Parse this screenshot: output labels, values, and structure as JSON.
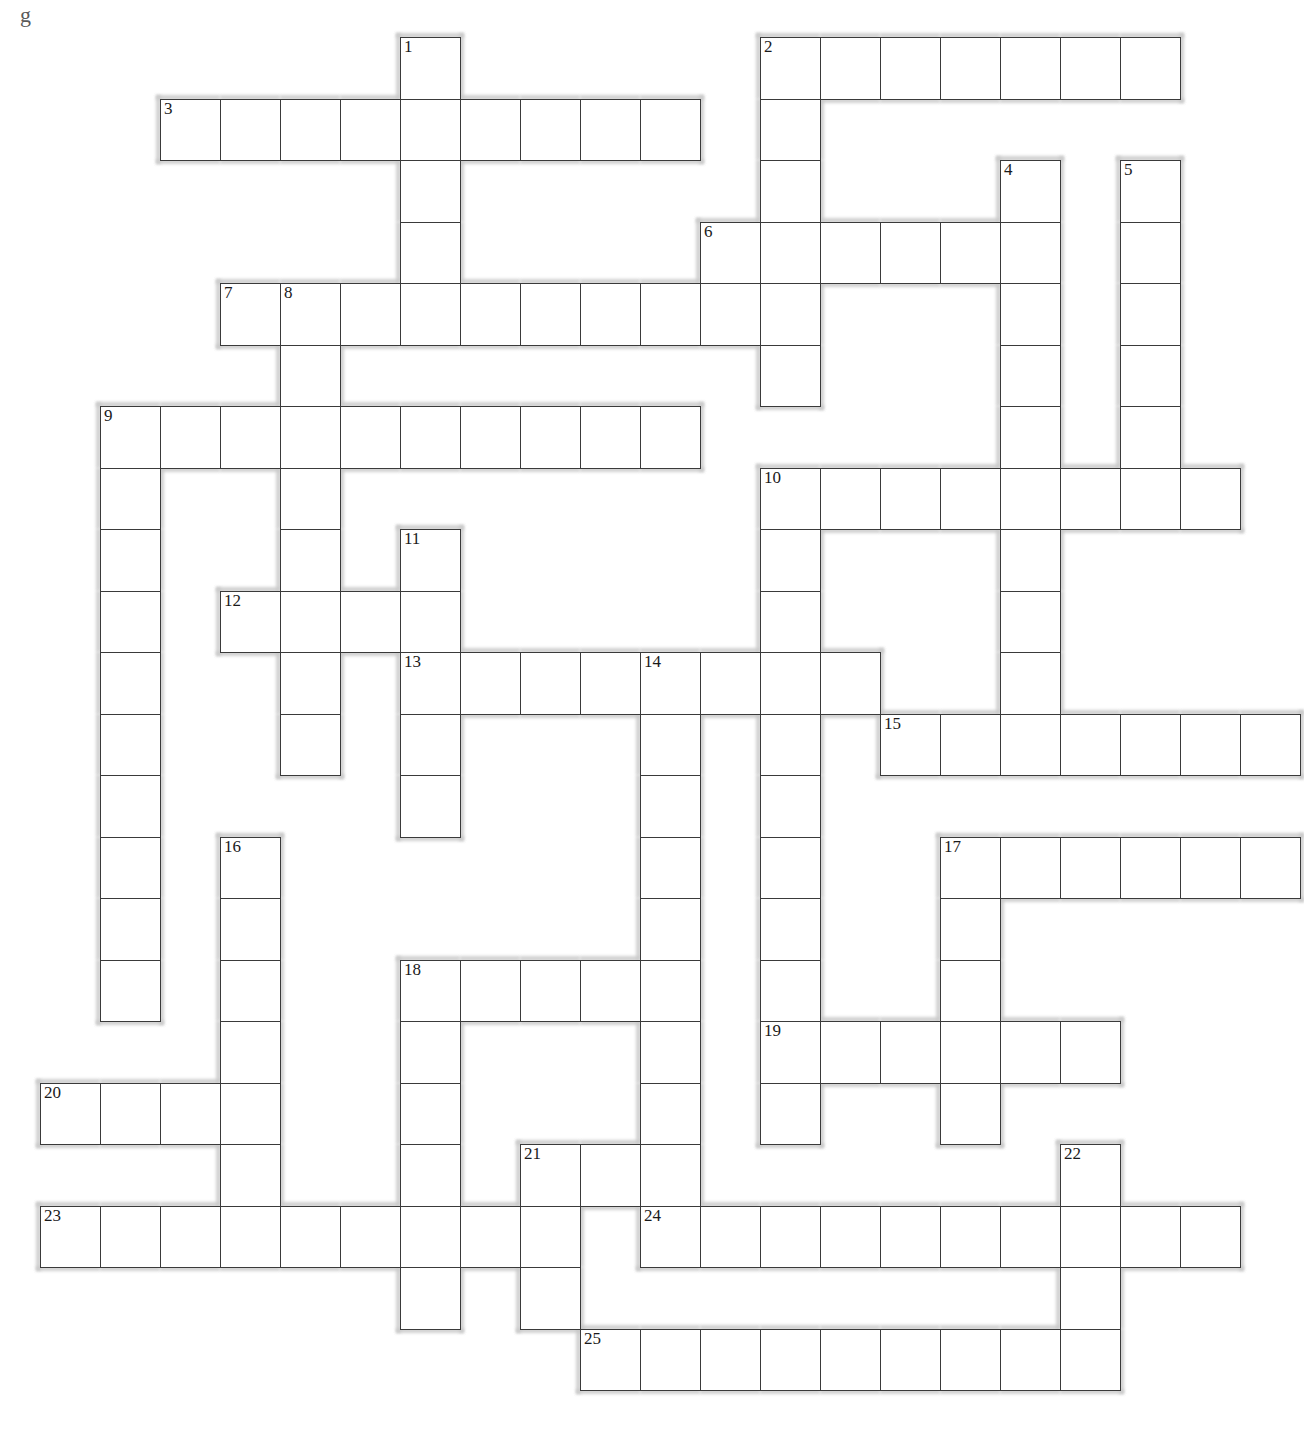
{
  "page": {
    "background_color": "#ffffff",
    "cell_border_color": "#3a3a3a",
    "halo_color": "#c9c9c9",
    "stray_mark_top_left": "g",
    "stray_mark_center": "з"
  },
  "grid": {
    "cell_size": 60,
    "row_height": 61.5,
    "origin_x": 40,
    "origin_y": 37,
    "columns": 21,
    "rows": 23,
    "numbered_clue_count": 25
  },
  "entries": [
    {
      "number": "1",
      "direction": "down",
      "col": 6,
      "row": 0,
      "length": 4
    },
    {
      "number": "2",
      "direction": "across",
      "col": 12,
      "row": 0,
      "length": 7
    },
    {
      "number": "2",
      "direction": "down",
      "col": 12,
      "row": 0,
      "length": 6
    },
    {
      "number": "3",
      "direction": "across",
      "col": 2,
      "row": 1,
      "length": 9
    },
    {
      "number": "4",
      "direction": "down",
      "col": 16,
      "row": 2,
      "length": 6
    },
    {
      "number": "5",
      "direction": "down",
      "col": 18,
      "row": 2,
      "length": 7
    },
    {
      "number": "6",
      "direction": "across",
      "col": 11,
      "row": 3,
      "length": 6
    },
    {
      "number": "7",
      "direction": "across",
      "col": 3,
      "row": 4,
      "length": 9
    },
    {
      "number": "8",
      "direction": "down",
      "col": 4,
      "row": 4,
      "length": 7
    },
    {
      "number": "9",
      "direction": "across",
      "col": 1,
      "row": 6,
      "length": 10
    },
    {
      "number": "9",
      "direction": "down",
      "col": 1,
      "row": 6,
      "length": 9
    },
    {
      "number": "10",
      "direction": "across",
      "col": 12,
      "row": 7,
      "length": 8
    },
    {
      "number": "10",
      "direction": "down",
      "col": 12,
      "row": 7,
      "length": 7
    },
    {
      "number": "11",
      "direction": "down",
      "col": 6,
      "row": 8,
      "length": 6
    },
    {
      "number": "12",
      "direction": "across",
      "col": 3,
      "row": 9,
      "length": 4
    },
    {
      "number": "13",
      "direction": "across",
      "col": 6,
      "row": 10,
      "length": 9
    },
    {
      "number": "13",
      "direction": "down",
      "col": 6,
      "row": 10,
      "length": 4
    },
    {
      "number": "14",
      "direction": "down",
      "col": 10,
      "row": 10,
      "length": 10
    },
    {
      "number": "15",
      "direction": "across",
      "col": 14,
      "row": 11,
      "length": 7
    },
    {
      "number": "16",
      "direction": "down",
      "col": 3,
      "row": 13,
      "length": 7
    },
    {
      "number": "17",
      "direction": "across",
      "col": 15,
      "row": 13,
      "length": 6
    },
    {
      "number": "17",
      "direction": "down",
      "col": 15,
      "row": 13,
      "length": 6
    },
    {
      "number": "18",
      "direction": "across",
      "col": 6,
      "row": 15,
      "length": 5
    },
    {
      "number": "18",
      "direction": "down",
      "col": 6,
      "row": 15,
      "length": 8
    },
    {
      "number": "19",
      "direction": "across",
      "col": 12,
      "row": 16,
      "length": 6
    },
    {
      "number": "20",
      "direction": "across",
      "col": 0,
      "row": 17,
      "length": 4
    },
    {
      "number": "21",
      "direction": "across",
      "col": 8,
      "row": 18,
      "length": 3
    },
    {
      "number": "22",
      "direction": "down",
      "col": 17,
      "row": 18,
      "length": 4
    },
    {
      "number": "23",
      "direction": "across",
      "col": 0,
      "row": 19,
      "length": 9
    },
    {
      "number": "24",
      "direction": "across",
      "col": 10,
      "row": 19,
      "length": 10
    },
    {
      "number": "25",
      "direction": "across",
      "col": 9,
      "row": 21,
      "length": 9
    }
  ],
  "cells": [
    {
      "c": 6,
      "r": 0,
      "n": "1"
    },
    {
      "c": 12,
      "r": 0,
      "n": "2"
    },
    {
      "c": 13,
      "r": 0
    },
    {
      "c": 14,
      "r": 0
    },
    {
      "c": 15,
      "r": 0
    },
    {
      "c": 16,
      "r": 0
    },
    {
      "c": 17,
      "r": 0
    },
    {
      "c": 18,
      "r": 0
    },
    {
      "c": 2,
      "r": 1,
      "n": "3"
    },
    {
      "c": 3,
      "r": 1
    },
    {
      "c": 4,
      "r": 1
    },
    {
      "c": 5,
      "r": 1
    },
    {
      "c": 6,
      "r": 1
    },
    {
      "c": 7,
      "r": 1
    },
    {
      "c": 8,
      "r": 1
    },
    {
      "c": 9,
      "r": 1
    },
    {
      "c": 10,
      "r": 1
    },
    {
      "c": 12,
      "r": 1
    },
    {
      "c": 6,
      "r": 2
    },
    {
      "c": 12,
      "r": 2
    },
    {
      "c": 16,
      "r": 2,
      "n": "4"
    },
    {
      "c": 18,
      "r": 2,
      "n": "5"
    },
    {
      "c": 6,
      "r": 3
    },
    {
      "c": 11,
      "r": 3,
      "n": "6"
    },
    {
      "c": 12,
      "r": 3
    },
    {
      "c": 13,
      "r": 3
    },
    {
      "c": 14,
      "r": 3
    },
    {
      "c": 15,
      "r": 3
    },
    {
      "c": 16,
      "r": 3
    },
    {
      "c": 18,
      "r": 3
    },
    {
      "c": 3,
      "r": 4,
      "n": "7"
    },
    {
      "c": 4,
      "r": 4,
      "n": "8"
    },
    {
      "c": 5,
      "r": 4
    },
    {
      "c": 6,
      "r": 4
    },
    {
      "c": 7,
      "r": 4
    },
    {
      "c": 8,
      "r": 4
    },
    {
      "c": 9,
      "r": 4
    },
    {
      "c": 10,
      "r": 4
    },
    {
      "c": 11,
      "r": 4
    },
    {
      "c": 12,
      "r": 4
    },
    {
      "c": 16,
      "r": 4
    },
    {
      "c": 18,
      "r": 4
    },
    {
      "c": 4,
      "r": 5
    },
    {
      "c": 12,
      "r": 5
    },
    {
      "c": 16,
      "r": 5
    },
    {
      "c": 18,
      "r": 5
    },
    {
      "c": 1,
      "r": 6,
      "n": "9"
    },
    {
      "c": 2,
      "r": 6
    },
    {
      "c": 3,
      "r": 6
    },
    {
      "c": 4,
      "r": 6
    },
    {
      "c": 5,
      "r": 6
    },
    {
      "c": 6,
      "r": 6
    },
    {
      "c": 7,
      "r": 6
    },
    {
      "c": 8,
      "r": 6
    },
    {
      "c": 9,
      "r": 6
    },
    {
      "c": 10,
      "r": 6
    },
    {
      "c": 16,
      "r": 6
    },
    {
      "c": 18,
      "r": 6
    },
    {
      "c": 1,
      "r": 7
    },
    {
      "c": 4,
      "r": 7
    },
    {
      "c": 12,
      "r": 7,
      "n": "10"
    },
    {
      "c": 13,
      "r": 7
    },
    {
      "c": 14,
      "r": 7
    },
    {
      "c": 15,
      "r": 7
    },
    {
      "c": 16,
      "r": 7
    },
    {
      "c": 17,
      "r": 7
    },
    {
      "c": 18,
      "r": 7
    },
    {
      "c": 19,
      "r": 7
    },
    {
      "c": 1,
      "r": 8
    },
    {
      "c": 4,
      "r": 8
    },
    {
      "c": 6,
      "r": 8,
      "n": "11"
    },
    {
      "c": 12,
      "r": 8
    },
    {
      "c": 16,
      "r": 8
    },
    {
      "c": 1,
      "r": 9
    },
    {
      "c": 3,
      "r": 9,
      "n": "12"
    },
    {
      "c": 4,
      "r": 9
    },
    {
      "c": 5,
      "r": 9
    },
    {
      "c": 6,
      "r": 9
    },
    {
      "c": 12,
      "r": 9
    },
    {
      "c": 16,
      "r": 9
    },
    {
      "c": 1,
      "r": 10
    },
    {
      "c": 4,
      "r": 10
    },
    {
      "c": 6,
      "r": 10,
      "n": "13"
    },
    {
      "c": 7,
      "r": 10
    },
    {
      "c": 8,
      "r": 10
    },
    {
      "c": 9,
      "r": 10
    },
    {
      "c": 10,
      "r": 10,
      "n": "14"
    },
    {
      "c": 11,
      "r": 10
    },
    {
      "c": 12,
      "r": 10
    },
    {
      "c": 13,
      "r": 10
    },
    {
      "c": 16,
      "r": 10
    },
    {
      "c": 1,
      "r": 11
    },
    {
      "c": 4,
      "r": 11
    },
    {
      "c": 6,
      "r": 11
    },
    {
      "c": 10,
      "r": 11
    },
    {
      "c": 12,
      "r": 11
    },
    {
      "c": 14,
      "r": 11,
      "n": "15"
    },
    {
      "c": 15,
      "r": 11
    },
    {
      "c": 16,
      "r": 11
    },
    {
      "c": 17,
      "r": 11
    },
    {
      "c": 18,
      "r": 11
    },
    {
      "c": 19,
      "r": 11
    },
    {
      "c": 20,
      "r": 11
    },
    {
      "c": 1,
      "r": 12
    },
    {
      "c": 6,
      "r": 12
    },
    {
      "c": 10,
      "r": 12
    },
    {
      "c": 12,
      "r": 12
    },
    {
      "c": 1,
      "r": 13
    },
    {
      "c": 3,
      "r": 13,
      "n": "16"
    },
    {
      "c": 10,
      "r": 13
    },
    {
      "c": 12,
      "r": 13
    },
    {
      "c": 15,
      "r": 13,
      "n": "17"
    },
    {
      "c": 16,
      "r": 13
    },
    {
      "c": 17,
      "r": 13
    },
    {
      "c": 18,
      "r": 13
    },
    {
      "c": 19,
      "r": 13
    },
    {
      "c": 20,
      "r": 13
    },
    {
      "c": 1,
      "r": 14
    },
    {
      "c": 3,
      "r": 14
    },
    {
      "c": 10,
      "r": 14
    },
    {
      "c": 12,
      "r": 14
    },
    {
      "c": 15,
      "r": 14
    },
    {
      "c": 1,
      "r": 15
    },
    {
      "c": 3,
      "r": 15
    },
    {
      "c": 6,
      "r": 15,
      "n": "18"
    },
    {
      "c": 7,
      "r": 15
    },
    {
      "c": 8,
      "r": 15
    },
    {
      "c": 9,
      "r": 15
    },
    {
      "c": 10,
      "r": 15
    },
    {
      "c": 12,
      "r": 15
    },
    {
      "c": 15,
      "r": 15
    },
    {
      "c": 3,
      "r": 16
    },
    {
      "c": 6,
      "r": 16
    },
    {
      "c": 10,
      "r": 16
    },
    {
      "c": 12,
      "r": 16,
      "n": "19"
    },
    {
      "c": 13,
      "r": 16
    },
    {
      "c": 14,
      "r": 16
    },
    {
      "c": 15,
      "r": 16
    },
    {
      "c": 16,
      "r": 16
    },
    {
      "c": 17,
      "r": 16
    },
    {
      "c": 0,
      "r": 17,
      "n": "20"
    },
    {
      "c": 1,
      "r": 17
    },
    {
      "c": 2,
      "r": 17
    },
    {
      "c": 3,
      "r": 17
    },
    {
      "c": 6,
      "r": 17
    },
    {
      "c": 10,
      "r": 17
    },
    {
      "c": 12,
      "r": 17
    },
    {
      "c": 15,
      "r": 17
    },
    {
      "c": 3,
      "r": 18
    },
    {
      "c": 6,
      "r": 18
    },
    {
      "c": 8,
      "r": 18,
      "n": "21"
    },
    {
      "c": 9,
      "r": 18
    },
    {
      "c": 10,
      "r": 18
    },
    {
      "c": 17,
      "r": 18,
      "n": "22"
    },
    {
      "c": 0,
      "r": 19,
      "n": "23"
    },
    {
      "c": 1,
      "r": 19
    },
    {
      "c": 2,
      "r": 19
    },
    {
      "c": 3,
      "r": 19
    },
    {
      "c": 4,
      "r": 19
    },
    {
      "c": 5,
      "r": 19
    },
    {
      "c": 6,
      "r": 19
    },
    {
      "c": 7,
      "r": 19
    },
    {
      "c": 8,
      "r": 19
    },
    {
      "c": 10,
      "r": 19,
      "n": "24"
    },
    {
      "c": 11,
      "r": 19
    },
    {
      "c": 12,
      "r": 19
    },
    {
      "c": 13,
      "r": 19
    },
    {
      "c": 14,
      "r": 19
    },
    {
      "c": 15,
      "r": 19
    },
    {
      "c": 16,
      "r": 19
    },
    {
      "c": 17,
      "r": 19
    },
    {
      "c": 18,
      "r": 19
    },
    {
      "c": 19,
      "r": 19
    },
    {
      "c": 6,
      "r": 20
    },
    {
      "c": 8,
      "r": 20
    },
    {
      "c": 17,
      "r": 20
    },
    {
      "c": 9,
      "r": 21,
      "n": "25"
    },
    {
      "c": 10,
      "r": 21
    },
    {
      "c": 11,
      "r": 21
    },
    {
      "c": 12,
      "r": 21
    },
    {
      "c": 13,
      "r": 21
    },
    {
      "c": 14,
      "r": 21
    },
    {
      "c": 15,
      "r": 21
    },
    {
      "c": 16,
      "r": 21
    },
    {
      "c": 17,
      "r": 21
    }
  ]
}
